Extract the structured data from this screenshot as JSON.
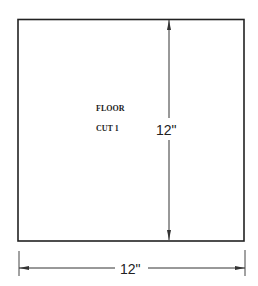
{
  "drawing": {
    "labels": {
      "line1": "FLOOR",
      "line2": "CUT 1"
    },
    "dimensions": {
      "vertical": "12\"",
      "horizontal": "12\""
    },
    "colors": {
      "line": "#222222",
      "background": "#ffffff"
    }
  }
}
